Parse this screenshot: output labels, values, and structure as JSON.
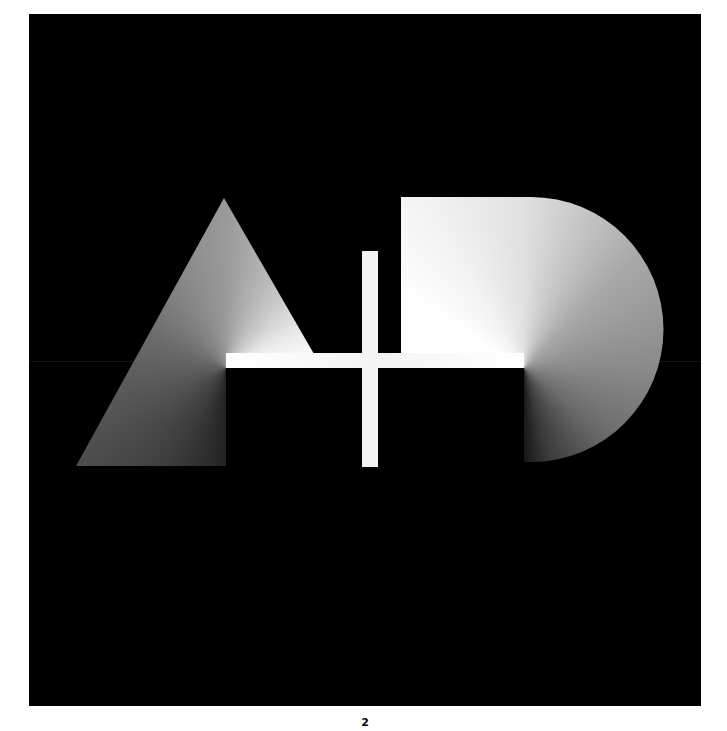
{
  "artwork": {
    "description": "Monogram A+D on black background with conic gradient fills",
    "background_color": "#000000",
    "page_background": "#ffffff",
    "glyphs": [
      "A",
      "+",
      "D"
    ]
  },
  "footer": {
    "page_number": "2"
  }
}
